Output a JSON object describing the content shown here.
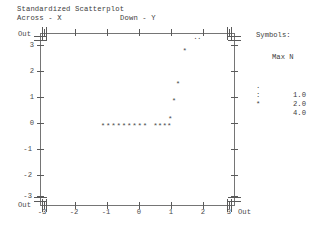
{
  "title": {
    "main": "Standardized Scatterplot",
    "across": "Across - X",
    "down": "Down - Y"
  },
  "legend": {
    "heading": "Symbols:",
    "column_header": "Max N",
    "entries": [
      {
        "symbol": ".",
        "value": "1.0"
      },
      {
        "symbol": ":",
        "value": "2.0"
      },
      {
        "symbol": "*",
        "value": "4.0"
      }
    ]
  },
  "axes": {
    "out_label": "Out",
    "x_ticks": [
      "-3",
      "-2",
      "-1",
      "0",
      "1",
      "2",
      "3"
    ],
    "y_ticks": [
      "3",
      "2",
      "1",
      "0",
      "-1",
      "-2",
      "-3"
    ],
    "x_out_left": "Out",
    "x_out_right": "Out",
    "y_out_top": "Out",
    "y_out_bottom": "Out"
  },
  "chart_data": {
    "type": "scatter",
    "title": "Standardized Scatterplot",
    "xlabel": "Across - X",
    "ylabel": "Down - Y",
    "xlim": [
      -3,
      3
    ],
    "ylim": [
      -3,
      3
    ],
    "grid": false,
    "legend_position": "right",
    "symbol_scale": [
      {
        "symbol": ".",
        "max_n": 1.0
      },
      {
        "symbol": ":",
        "max_n": 2.0
      },
      {
        "symbol": "*",
        "max_n": 4.0
      }
    ],
    "points": [
      {
        "x": -1.1,
        "y": -0.25,
        "symbol": "*"
      },
      {
        "x": -0.93,
        "y": -0.25,
        "symbol": "*"
      },
      {
        "x": -0.76,
        "y": -0.25,
        "symbol": "*"
      },
      {
        "x": -0.59,
        "y": -0.25,
        "symbol": "*"
      },
      {
        "x": -0.42,
        "y": -0.25,
        "symbol": "*"
      },
      {
        "x": -0.25,
        "y": -0.25,
        "symbol": "*"
      },
      {
        "x": -0.08,
        "y": -0.25,
        "symbol": "*"
      },
      {
        "x": 0.09,
        "y": -0.25,
        "symbol": "*"
      },
      {
        "x": 0.26,
        "y": -0.25,
        "symbol": "*"
      },
      {
        "x": 0.6,
        "y": -0.25,
        "symbol": "*"
      },
      {
        "x": 0.75,
        "y": -0.25,
        "symbol": "*"
      },
      {
        "x": 0.9,
        "y": -0.25,
        "symbol": "*"
      },
      {
        "x": 1.05,
        "y": -0.25,
        "symbol": "*"
      },
      {
        "x": 1.08,
        "y": 0.05,
        "symbol": "*"
      },
      {
        "x": 1.2,
        "y": 0.75,
        "symbol": "*"
      },
      {
        "x": 1.33,
        "y": 1.42,
        "symbol": "*"
      },
      {
        "x": 1.55,
        "y": 2.75,
        "symbol": "*"
      },
      {
        "x": 1.9,
        "y": 3.3,
        "symbol": ".",
        "out": true
      },
      {
        "x": 2.02,
        "y": 3.3,
        "symbol": ".",
        "out": true
      }
    ]
  }
}
